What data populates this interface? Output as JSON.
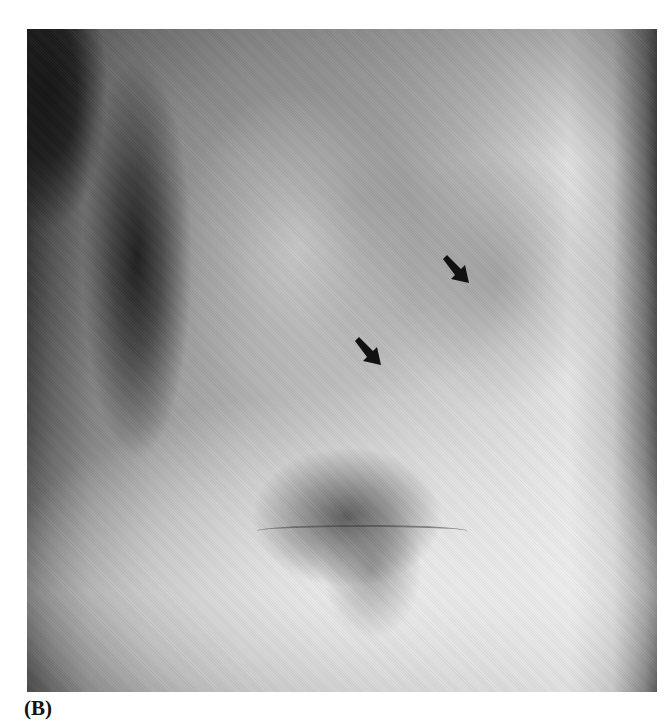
{
  "figure": {
    "panel_label": "(B)",
    "image_description": "lateral chest radiograph",
    "annotations": [
      {
        "type": "arrow",
        "icon": "arrow-down-right-icon",
        "x": 456,
        "y": 270,
        "color": "#111111"
      },
      {
        "type": "arrow",
        "icon": "arrow-down-right-icon",
        "x": 367,
        "y": 352,
        "color": "#111111"
      }
    ]
  }
}
